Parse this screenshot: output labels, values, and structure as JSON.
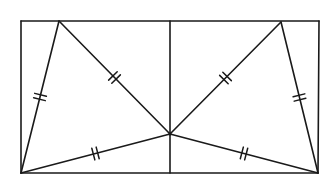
{
  "diagram": {
    "type": "geometry",
    "stroke_color": "#1a1a1a",
    "background_color": "#ffffff",
    "points": {
      "A": {
        "x": 21,
        "y": 21,
        "label": "rectangle-top-left"
      },
      "B": {
        "x": 319,
        "y": 21,
        "label": "rectangle-top-right"
      },
      "C": {
        "x": 318,
        "y": 173,
        "label": "rectangle-bottom-right"
      },
      "D": {
        "x": 21,
        "y": 173,
        "label": "rectangle-bottom-left"
      },
      "E": {
        "x": 59,
        "y": 21,
        "label": "top-left-vertex"
      },
      "F": {
        "x": 281,
        "y": 22,
        "label": "top-right-vertex"
      },
      "M": {
        "x": 170,
        "y": 21,
        "label": "top-midpoint"
      },
      "N": {
        "x": 170,
        "y": 173,
        "label": "bottom-midpoint"
      },
      "P": {
        "x": 170,
        "y": 134,
        "label": "interior-point"
      }
    },
    "segments": [
      {
        "from": "A",
        "to": "B",
        "role": "rectangle-top"
      },
      {
        "from": "B",
        "to": "C",
        "role": "rectangle-right"
      },
      {
        "from": "C",
        "to": "D",
        "role": "rectangle-bottom"
      },
      {
        "from": "D",
        "to": "A",
        "role": "rectangle-left"
      },
      {
        "from": "M",
        "to": "N",
        "role": "vertical-midline"
      },
      {
        "from": "E",
        "to": "D",
        "role": "left-triangle-side",
        "ticks": 2
      },
      {
        "from": "E",
        "to": "P",
        "role": "left-triangle-diagonal",
        "ticks": 2
      },
      {
        "from": "D",
        "to": "P",
        "role": "left-triangle-base",
        "ticks": 2
      },
      {
        "from": "F",
        "to": "C",
        "role": "right-triangle-side",
        "ticks": 2
      },
      {
        "from": "F",
        "to": "P",
        "role": "right-triangle-diagonal",
        "ticks": 2
      },
      {
        "from": "C",
        "to": "P",
        "role": "right-triangle-base",
        "ticks": 2
      }
    ],
    "tick_marks_per_segment": 2
  }
}
